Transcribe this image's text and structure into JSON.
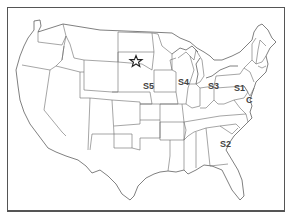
{
  "map": {
    "title": "Contiguous United States",
    "marker": {
      "type": "star-icon",
      "x": 136,
      "y": 61,
      "state": "South Dakota"
    },
    "labels": [
      {
        "id": "S1",
        "text": "S1",
        "x": 234,
        "y": 91
      },
      {
        "id": "C",
        "text": "C",
        "x": 246,
        "y": 103
      },
      {
        "id": "S2",
        "text": "S2",
        "x": 220,
        "y": 147
      },
      {
        "id": "S3",
        "text": "S3",
        "x": 208,
        "y": 89
      },
      {
        "id": "S4",
        "text": "S4",
        "x": 178,
        "y": 85
      },
      {
        "id": "S5",
        "text": "S5",
        "x": 143,
        "y": 89
      }
    ],
    "colors": {
      "outline": "#555555",
      "state_border": "#6a6a6a",
      "label": "#444444",
      "background": "#ffffff"
    }
  }
}
